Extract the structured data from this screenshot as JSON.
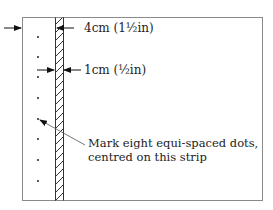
{
  "diagram": {
    "type": "marking-guide",
    "labels": {
      "strip_offset": "4cm (1½in)",
      "strip_width": "1cm (½in)",
      "instruction_line1": "Mark eight equi-spaced dots,",
      "instruction_line2": "centred on this strip"
    },
    "dot_count": 8,
    "colors": {
      "line": "#333333",
      "border": "#8a8a8a",
      "text": "#222222",
      "background": "#ffffff"
    }
  }
}
